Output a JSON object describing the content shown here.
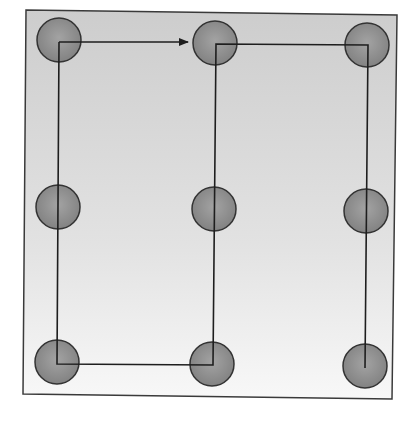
{
  "diagram": {
    "title": "",
    "type": "nine-dot grid path",
    "canvas": {
      "width": 409,
      "height": 425
    },
    "frame": {
      "points": [
        [
          26,
          10
        ],
        [
          397,
          15
        ],
        [
          392,
          399
        ],
        [
          23,
          394
        ]
      ],
      "stroke": "#3a3a3a",
      "gradient_top": "#cdcdcd",
      "gradient_mid": "#e2e2e2",
      "gradient_bottom": "#f8f8f8"
    },
    "dot_style": {
      "radius": 22,
      "fill_center": "#a3a3a3",
      "fill_edge": "#828282",
      "stroke": "#333333"
    },
    "dots": [
      {
        "id": "top-left",
        "row": 1,
        "col": 1,
        "cx": 59,
        "cy": 40
      },
      {
        "id": "top-middle",
        "row": 1,
        "col": 2,
        "cx": 215,
        "cy": 43
      },
      {
        "id": "top-right",
        "row": 1,
        "col": 3,
        "cx": 367,
        "cy": 45
      },
      {
        "id": "middle-left",
        "row": 2,
        "col": 1,
        "cx": 58,
        "cy": 207
      },
      {
        "id": "middle-middle",
        "row": 2,
        "col": 2,
        "cx": 214,
        "cy": 209
      },
      {
        "id": "middle-right",
        "row": 2,
        "col": 3,
        "cx": 366,
        "cy": 211
      },
      {
        "id": "bottom-left",
        "row": 3,
        "col": 1,
        "cx": 57,
        "cy": 362
      },
      {
        "id": "bottom-middle",
        "row": 3,
        "col": 2,
        "cx": 212,
        "cy": 364
      },
      {
        "id": "bottom-right",
        "row": 3,
        "col": 3,
        "cx": 365,
        "cy": 366
      }
    ],
    "arrow": {
      "from": [
        59,
        42
      ],
      "to": [
        188,
        42
      ],
      "stroke": "#1e1e1e",
      "head": "right"
    },
    "path": {
      "points": [
        [
          59,
          42
        ],
        [
          57,
          364
        ],
        [
          213,
          365
        ],
        [
          216,
          44
        ],
        [
          368,
          45
        ],
        [
          365,
          368
        ]
      ],
      "stroke": "#1e1e1e",
      "stroke_width": 1.6
    }
  }
}
